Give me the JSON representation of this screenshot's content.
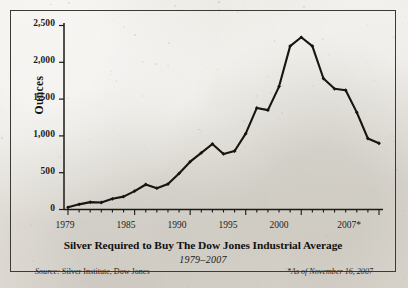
{
  "figure": {
    "frame_color": "#3b3a36",
    "background_color": "#e8e6e0",
    "ink_color": "#16150f"
  },
  "axis": {
    "y_title": "Ounces",
    "y_ticks": [
      "0",
      "500",
      "1,000",
      "1,500",
      "2,000",
      "2,500"
    ],
    "x_ticks": [
      "1979",
      "1985",
      "1990",
      "1995",
      "2000",
      "2007*"
    ]
  },
  "titles": {
    "main": "Silver Required to Buy The Dow Jones Industrial Average",
    "subtitle": "1979–2007"
  },
  "notes": {
    "source_label": "Source:",
    "source_text": "Silver Institute, Dow Jones",
    "footnote": "*As of November 16, 2007"
  },
  "chart_data": {
    "type": "line",
    "title": "Silver Required to Buy The Dow Jones Industrial Average",
    "subtitle": "1979–2007",
    "xlabel": "",
    "ylabel": "Ounces",
    "xlim": [
      1979,
      2007
    ],
    "ylim": [
      0,
      2500
    ],
    "ytick_values": [
      0,
      500,
      1000,
      1500,
      2000,
      2500
    ],
    "ytick_labels": [
      "0",
      "500",
      "1,000",
      "1,500",
      "2,000",
      "2,500"
    ],
    "xtick_values": [
      1979,
      1985,
      1990,
      1995,
      2000,
      2007
    ],
    "xtick_labels": [
      "1979",
      "1985",
      "1990",
      "1995",
      "2000",
      "2007*"
    ],
    "minor_x_ticks_every": 1,
    "grid": false,
    "legend": false,
    "markers": "filled-diamond",
    "series": [
      {
        "name": "Ounces of silver required to buy the DJIA",
        "x": [
          1979,
          1980,
          1981,
          1982,
          1983,
          1984,
          1985,
          1986,
          1987,
          1988,
          1989,
          1990,
          1991,
          1992,
          1993,
          1994,
          1995,
          1996,
          1997,
          1998,
          1999,
          2000,
          2001,
          2002,
          2003,
          2004,
          2005,
          2006,
          2007
        ],
        "values": [
          30,
          70,
          100,
          95,
          145,
          175,
          250,
          340,
          290,
          345,
          490,
          650,
          770,
          890,
          755,
          795,
          1030,
          1380,
          1350,
          1670,
          2220,
          2340,
          2220,
          1780,
          1640,
          1620,
          1320,
          965,
          900
        ]
      }
    ],
    "annotations": [
      "Source: Silver Institute, Dow Jones",
      "*As of November 16, 2007"
    ]
  }
}
